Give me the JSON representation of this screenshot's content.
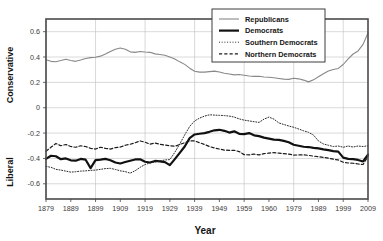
{
  "chart_data": {
    "type": "line",
    "title": "",
    "xlabel": "Year",
    "ylabel_top": "Conservative",
    "ylabel_bottom": "Liberal",
    "grid": true,
    "legend_position": "top-center",
    "xlim": [
      1879,
      2009
    ],
    "ylim": [
      -0.72,
      0.7
    ],
    "yticks": [
      "0.6",
      "0.4",
      "0.2",
      "0",
      "-0.2",
      "-0.4",
      "-0.6"
    ],
    "ytick_values": [
      0.6,
      0.4,
      0.2,
      0,
      -0.2,
      -0.4,
      -0.6
    ],
    "xticks": [
      "1879",
      "1889",
      "1899",
      "1909",
      "1919",
      "1929",
      "1939",
      "1949",
      "1959",
      "1960",
      "1979",
      "1989",
      "1999",
      "2009"
    ],
    "xtick_values": [
      1879,
      1889,
      1899,
      1909,
      1919,
      1929,
      1939,
      1949,
      1959,
      1969,
      1979,
      1989,
      1999,
      2009
    ],
    "x": [
      1879,
      1881,
      1883,
      1885,
      1887,
      1889,
      1891,
      1893,
      1895,
      1897,
      1899,
      1901,
      1903,
      1905,
      1907,
      1909,
      1911,
      1913,
      1915,
      1917,
      1919,
      1921,
      1923,
      1925,
      1927,
      1929,
      1931,
      1933,
      1935,
      1937,
      1939,
      1941,
      1943,
      1945,
      1947,
      1949,
      1951,
      1953,
      1955,
      1957,
      1959,
      1961,
      1963,
      1965,
      1967,
      1969,
      1971,
      1973,
      1975,
      1977,
      1979,
      1981,
      1983,
      1985,
      1987,
      1989,
      1991,
      1993,
      1995,
      1997,
      1999,
      2001,
      2003,
      2005,
      2007,
      2009
    ],
    "series": [
      {
        "name": "Republicans",
        "color": "#888888",
        "style": "solid",
        "width": 1.1,
        "values": [
          0.378,
          0.366,
          0.363,
          0.372,
          0.383,
          0.372,
          0.366,
          0.377,
          0.389,
          0.395,
          0.398,
          0.407,
          0.424,
          0.444,
          0.461,
          0.471,
          0.462,
          0.441,
          0.437,
          0.444,
          0.44,
          0.437,
          0.425,
          0.42,
          0.414,
          0.401,
          0.385,
          0.362,
          0.342,
          0.312,
          0.288,
          0.281,
          0.281,
          0.285,
          0.289,
          0.282,
          0.272,
          0.266,
          0.259,
          0.262,
          0.256,
          0.25,
          0.247,
          0.248,
          0.243,
          0.24,
          0.236,
          0.231,
          0.226,
          0.224,
          0.232,
          0.228,
          0.218,
          0.204,
          0.22,
          0.244,
          0.268,
          0.29,
          0.302,
          0.31,
          0.341,
          0.386,
          0.424,
          0.448,
          0.5,
          0.59
        ]
      },
      {
        "name": "Democrats",
        "color": "#111111",
        "style": "solid",
        "width": 2.2,
        "values": [
          -0.404,
          -0.379,
          -0.383,
          -0.406,
          -0.4,
          -0.415,
          -0.418,
          -0.404,
          -0.41,
          -0.476,
          -0.414,
          -0.41,
          -0.404,
          -0.414,
          -0.432,
          -0.44,
          -0.428,
          -0.418,
          -0.408,
          -0.407,
          -0.426,
          -0.432,
          -0.42,
          -0.423,
          -0.429,
          -0.453,
          -0.405,
          -0.356,
          -0.306,
          -0.24,
          -0.211,
          -0.205,
          -0.2,
          -0.19,
          -0.178,
          -0.174,
          -0.182,
          -0.196,
          -0.186,
          -0.206,
          -0.208,
          -0.2,
          -0.218,
          -0.224,
          -0.236,
          -0.244,
          -0.252,
          -0.254,
          -0.262,
          -0.272,
          -0.292,
          -0.3,
          -0.308,
          -0.31,
          -0.316,
          -0.32,
          -0.328,
          -0.334,
          -0.342,
          -0.346,
          -0.394,
          -0.404,
          -0.406,
          -0.412,
          -0.424,
          -0.37
        ]
      },
      {
        "name": "Southern Democrats",
        "color": "#2a2a2a",
        "style": "dotted",
        "width": 1.0,
        "values": [
          -0.463,
          -0.47,
          -0.486,
          -0.492,
          -0.5,
          -0.508,
          -0.505,
          -0.5,
          -0.498,
          -0.494,
          -0.492,
          -0.486,
          -0.48,
          -0.478,
          -0.487,
          -0.498,
          -0.504,
          -0.516,
          -0.497,
          -0.47,
          -0.448,
          -0.436,
          -0.428,
          -0.42,
          -0.412,
          -0.409,
          -0.352,
          -0.286,
          -0.214,
          -0.148,
          -0.104,
          -0.082,
          -0.066,
          -0.056,
          -0.058,
          -0.06,
          -0.062,
          -0.066,
          -0.074,
          -0.088,
          -0.098,
          -0.104,
          -0.11,
          -0.116,
          -0.09,
          -0.074,
          -0.09,
          -0.12,
          -0.132,
          -0.144,
          -0.154,
          -0.168,
          -0.182,
          -0.194,
          -0.216,
          -0.262,
          -0.286,
          -0.296,
          -0.306,
          -0.302,
          -0.312,
          -0.302,
          -0.31,
          -0.302,
          -0.306,
          -0.3
        ]
      },
      {
        "name": "Northern Democrats",
        "color": "#1a1a1a",
        "style": "dashed",
        "width": 1.2,
        "values": [
          -0.343,
          -0.312,
          -0.282,
          -0.3,
          -0.29,
          -0.306,
          -0.312,
          -0.3,
          -0.306,
          -0.32,
          -0.326,
          -0.312,
          -0.32,
          -0.326,
          -0.314,
          -0.31,
          -0.296,
          -0.288,
          -0.276,
          -0.262,
          -0.272,
          -0.288,
          -0.278,
          -0.288,
          -0.294,
          -0.3,
          -0.304,
          -0.29,
          -0.276,
          -0.262,
          -0.262,
          -0.276,
          -0.29,
          -0.306,
          -0.318,
          -0.326,
          -0.334,
          -0.336,
          -0.336,
          -0.346,
          -0.37,
          -0.372,
          -0.366,
          -0.372,
          -0.362,
          -0.358,
          -0.354,
          -0.358,
          -0.362,
          -0.366,
          -0.374,
          -0.372,
          -0.372,
          -0.376,
          -0.382,
          -0.386,
          -0.392,
          -0.398,
          -0.406,
          -0.412,
          -0.43,
          -0.436,
          -0.438,
          -0.444,
          -0.448,
          -0.384
        ]
      }
    ]
  },
  "legend": {
    "items": [
      {
        "label": "Republicans"
      },
      {
        "label": "Democrats"
      },
      {
        "label": "Southern Democrats"
      },
      {
        "label": "Northern Democrats"
      }
    ]
  },
  "axes": {
    "y_top_label": "Conservative",
    "y_bottom_label": "Liberal",
    "x_title": "Year"
  }
}
